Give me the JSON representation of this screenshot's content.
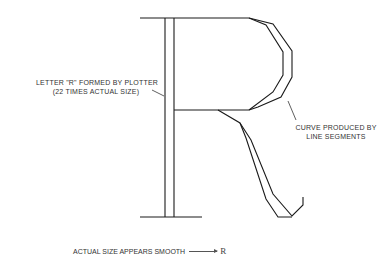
{
  "figure": {
    "label_left_line1": "LETTER \"R\" FORMED BY PLOTTER",
    "label_left_line2": "(22 TIMES ACTUAL SIZE)",
    "label_right_line1": "CURVE PRODUCED BY",
    "label_right_line2": "LINE SEGMENTS",
    "caption": "ACTUAL SIZE APPEARS SMOOTH",
    "small_letter": "R",
    "stroke_color": "#1a1a1a"
  }
}
